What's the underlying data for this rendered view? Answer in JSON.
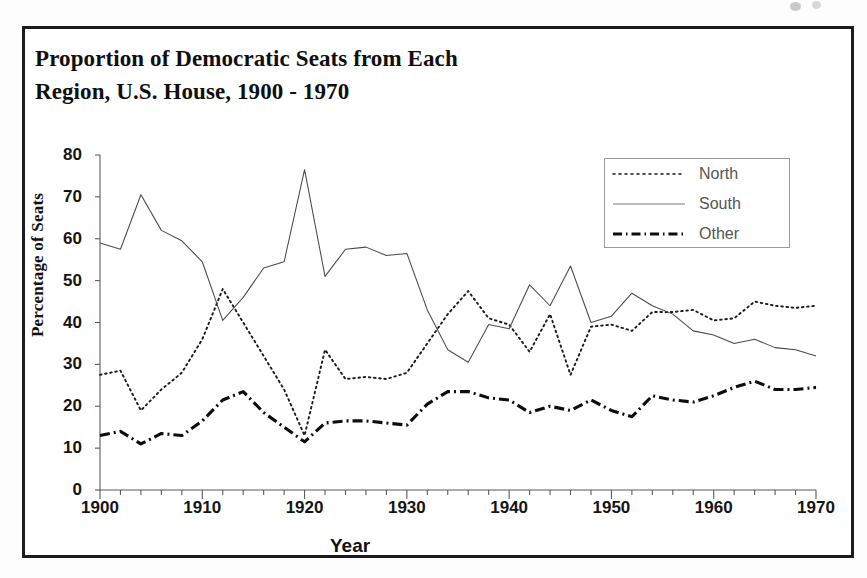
{
  "figure": {
    "title_line1": "Proportion of Democratic Seats from Each",
    "title_line2": "Region, U.S. House, 1900 - 1970",
    "frame_color": "#1c1c1c"
  },
  "legend": {
    "position": "top-right",
    "entries": [
      {
        "label": "North",
        "style": "dotted"
      },
      {
        "label": "South",
        "style": "solid"
      },
      {
        "label": "Other",
        "style": "dash-dot"
      }
    ]
  },
  "axes": {
    "x": {
      "label": "Year",
      "ticks": [
        "1900",
        "1910",
        "1920",
        "1930",
        "1940",
        "1950",
        "1960",
        "1970"
      ],
      "min": 1900,
      "max": 1970,
      "minor_tick_step": 2
    },
    "y": {
      "label": "Percentage of Seats",
      "ticks": [
        "0",
        "10",
        "20",
        "30",
        "40",
        "50",
        "60",
        "70",
        "80"
      ],
      "min": 0,
      "max": 80,
      "step": 10
    }
  },
  "chart_data": {
    "type": "line",
    "title": "Proportion of Democratic Seats from Each Region, U.S. House, 1900 - 1970",
    "xlabel": "Year",
    "ylabel": "Percentage of Seats",
    "xlim": [
      1900,
      1970
    ],
    "ylim": [
      0,
      80
    ],
    "grid": false,
    "legend_position": "top-right",
    "x": [
      1900,
      1902,
      1904,
      1906,
      1908,
      1910,
      1912,
      1914,
      1916,
      1918,
      1920,
      1922,
      1924,
      1926,
      1928,
      1930,
      1932,
      1934,
      1936,
      1938,
      1940,
      1942,
      1944,
      1946,
      1948,
      1950,
      1952,
      1954,
      1956,
      1958,
      1960,
      1962,
      1964,
      1966,
      1968,
      1970
    ],
    "series": [
      {
        "name": "North",
        "style": "dotted",
        "color": "#1a1a1a",
        "values": [
          27.5,
          28.5,
          19.0,
          24.0,
          28.0,
          36.0,
          48.0,
          40.0,
          32.0,
          24.0,
          13.0,
          33.5,
          26.5,
          27.0,
          26.5,
          28.0,
          35.0,
          42.0,
          47.5,
          41.0,
          39.5,
          33.0,
          42.0,
          27.5,
          39.0,
          39.5,
          38.0,
          42.5,
          42.5,
          43.0,
          40.5,
          41.0,
          45.0,
          44.0,
          43.5,
          44.0
        ]
      },
      {
        "name": "South",
        "style": "solid",
        "color": "#3a3a3a",
        "values": [
          59.0,
          57.5,
          70.5,
          62.0,
          59.5,
          54.5,
          40.5,
          46.0,
          53.0,
          54.5,
          76.5,
          51.0,
          57.5,
          58.0,
          56.0,
          56.5,
          43.0,
          33.5,
          30.5,
          39.5,
          38.5,
          49.0,
          44.0,
          53.5,
          40.0,
          41.5,
          47.0,
          44.0,
          42.0,
          38.0,
          37.0,
          35.0,
          36.0,
          34.0,
          33.5,
          32.0
        ]
      },
      {
        "name": "Other",
        "style": "dash-dot",
        "color": "#0d0d0d",
        "values": [
          13.0,
          14.0,
          11.0,
          13.5,
          13.0,
          16.5,
          21.5,
          23.5,
          18.5,
          15.0,
          11.5,
          16.0,
          16.5,
          16.5,
          16.0,
          15.5,
          20.5,
          23.5,
          23.5,
          22.0,
          21.5,
          18.5,
          20.0,
          19.0,
          21.5,
          19.0,
          17.5,
          22.5,
          21.5,
          21.0,
          22.5,
          24.5,
          26.0,
          24.0,
          24.0,
          24.5
        ]
      }
    ]
  }
}
